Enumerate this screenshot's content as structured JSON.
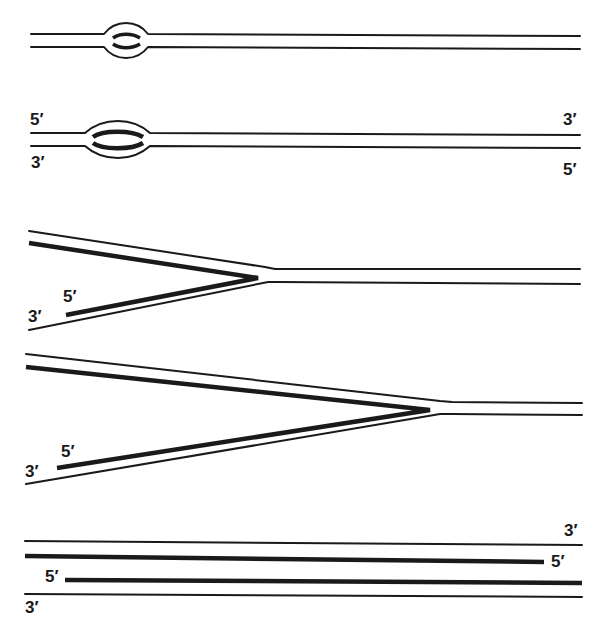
{
  "diagram": {
    "stages": [
      {
        "id": "stage-1",
        "description": "Small replication bubble",
        "labels": []
      },
      {
        "id": "stage-2",
        "description": "Larger replication bubble",
        "labels": {
          "top_left": "5′",
          "bottom_left": "3′",
          "top_right": "3′",
          "bottom_right": "5′"
        }
      },
      {
        "id": "stage-3",
        "description": "Replication fork with short new strands",
        "labels": {
          "new_strand_end": "5′",
          "template_end": "3′"
        }
      },
      {
        "id": "stage-4",
        "description": "Replication fork with longer new strands",
        "labels": {
          "new_strand_end": "5′",
          "template_end": "3′"
        }
      },
      {
        "id": "stage-5",
        "description": "Two daughter duplexes",
        "labels": {
          "top_right": "3′",
          "new_top_right": "5′",
          "new_bottom_left": "5′",
          "bottom_left": "3′"
        }
      }
    ],
    "colors": {
      "ink": "#1a1a1a",
      "background": "#ffffff"
    }
  }
}
